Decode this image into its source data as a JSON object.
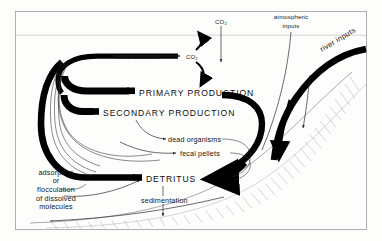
{
  "figure": {
    "frame_color": "#9a9a9a",
    "background_color": "#fdfdfc",
    "ink_color": "#000000"
  },
  "labels": {
    "co2_top": "CO₂",
    "atmospheric_inputs_line1": "atmospheric",
    "atmospheric_inputs_line2": "inputs",
    "river_inputs": "river  inputs",
    "mineralization": "mineralization",
    "co2_mid": "CO₂",
    "primary_production": "PRIMARY   PRODUCTION",
    "secondary_production": "SECONDARY   PRODUCTION",
    "dead_organisms": "dead  organisms",
    "fecal_pellets": "fecal  pellets",
    "detritus": "DETRITUS",
    "sedimentation": "sedimentation",
    "adsorption_line1": "adsorption",
    "adsorption_line2": "or",
    "adsorption_line3": "flocculation",
    "adsorption_line4": "of  dissolved",
    "adsorption_line5": "molecules"
  },
  "flows": {
    "co2_downward_arrow": "atmospheric CO2 flux into surface water",
    "mineralization_arrow": "mineralization to CO2",
    "co2_uptake_curve": "CO2 to primary production",
    "co2_release_curve": "mineralization CO2 to atmosphere",
    "primary_to_secondary": "primary production feeds secondary production",
    "dead_organisms_to_detritus": "dead organisms become detritus",
    "fecal_pellets_to_detritus": "fecal pellets become detritus",
    "detritus_recycle": "detritus returns via mineralization loop",
    "sedimentation_arrow": "detritus settles to sediment",
    "river_input_flow": "river inputs enter coastal water",
    "atmospheric_input_flow": "atmospheric inputs enter coastal water",
    "seafloor_transport": "seaward sediment transport"
  }
}
